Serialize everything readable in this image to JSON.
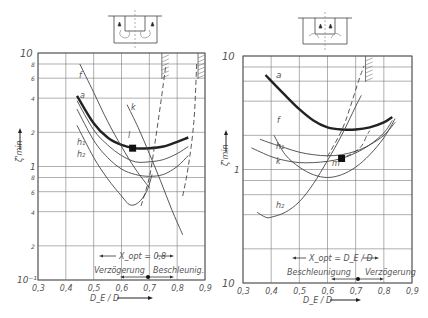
{
  "chart_data": [
    {
      "type": "line",
      "title": "",
      "xlabel": "D_E / D",
      "ylabel": "ζ'_min",
      "yscale": "log",
      "xlim": [
        0.3,
        0.9
      ],
      "ylim": [
        0.1,
        10
      ],
      "x_ticks": [
        "0,3",
        "0,4",
        "0,5",
        "0,6",
        "0,7",
        "0,8",
        "0,9"
      ],
      "y_ticks": [
        "10",
        "8",
        "6",
        "4",
        "2",
        "1",
        "8",
        "6",
        "4",
        "2",
        "10⁻¹"
      ],
      "grid": true,
      "annotations": {
        "x_opt": "X_opt = 0,8",
        "left_region": "Verzögerung",
        "right_region": "Beschleunig.",
        "marker_point": {
          "x": 0.64,
          "y": 1.45,
          "label": "l"
        }
      },
      "series": [
        {
          "name": "a",
          "style": "thick",
          "x": [
            0.44,
            0.5,
            0.55,
            0.6,
            0.65,
            0.7,
            0.75,
            0.8,
            0.84
          ],
          "y": [
            4.2,
            2.4,
            1.8,
            1.55,
            1.45,
            1.45,
            1.5,
            1.65,
            1.8
          ]
        },
        {
          "name": "f",
          "style": "thin",
          "x": [
            0.45,
            0.5,
            0.55,
            0.6,
            0.65,
            0.7
          ],
          "y": [
            8.0,
            4.5,
            2.5,
            1.5,
            0.95,
            0.65
          ]
        },
        {
          "name": "k",
          "style": "thin",
          "x": [
            0.62,
            0.66,
            0.7,
            0.74,
            0.78,
            0.82
          ],
          "y": [
            3.5,
            2.2,
            1.3,
            0.75,
            0.42,
            0.25
          ]
        },
        {
          "name": "h1",
          "style": "thin",
          "x": [
            0.44,
            0.5,
            0.55,
            0.6,
            0.65,
            0.7,
            0.75,
            0.8,
            0.84
          ],
          "y": [
            3.8,
            2.1,
            1.55,
            1.25,
            1.1,
            1.1,
            1.15,
            1.3,
            1.5
          ]
        },
        {
          "name": "h2",
          "style": "thin",
          "x": [
            0.44,
            0.5,
            0.55,
            0.6,
            0.65,
            0.7,
            0.75,
            0.8,
            0.84
          ],
          "y": [
            3.2,
            1.7,
            1.2,
            0.95,
            0.85,
            0.82,
            0.85,
            1.0,
            1.25
          ]
        },
        {
          "name": "lowest",
          "style": "thin",
          "x": [
            0.44,
            0.5,
            0.55,
            0.6,
            0.63,
            0.66,
            0.69,
            0.71
          ],
          "y": [
            2.3,
            1.2,
            0.78,
            0.55,
            0.46,
            0.48,
            0.6,
            0.85
          ]
        },
        {
          "name": "dashed-1",
          "style": "dashed",
          "x": [
            0.67,
            0.7,
            0.72,
            0.74,
            0.76
          ],
          "y": [
            0.45,
            0.8,
            1.6,
            3.5,
            8.0
          ]
        },
        {
          "name": "dashed-2",
          "style": "dashed",
          "x": [
            0.82,
            0.84,
            0.86,
            0.87
          ],
          "y": [
            0.55,
            1.0,
            2.5,
            8.0
          ]
        }
      ]
    },
    {
      "type": "line",
      "title": "",
      "xlabel": "D_E / D",
      "ylabel": "ζ'_min",
      "yscale": "log",
      "xlim": [
        0.3,
        0.9
      ],
      "ylim": [
        0.1,
        10
      ],
      "x_ticks": [
        "0,3",
        "0,4",
        "0,5",
        "0,6",
        "0,7",
        "0,8",
        "0,9"
      ],
      "y_ticks": [
        "10",
        "1",
        "10"
      ],
      "grid": true,
      "annotations": {
        "x_opt": "X_opt = D_E / D",
        "left_region": "Beschleunigung",
        "right_region": "Verzögerung",
        "marker_point": {
          "x": 0.65,
          "y": 1.25,
          "label": "m"
        }
      },
      "series": [
        {
          "name": "a",
          "style": "thick",
          "x": [
            0.38,
            0.45,
            0.5,
            0.55,
            0.6,
            0.65,
            0.7,
            0.75,
            0.8,
            0.83
          ],
          "y": [
            6.8,
            4.5,
            3.4,
            2.7,
            2.35,
            2.25,
            2.25,
            2.35,
            2.6,
            2.9
          ]
        },
        {
          "name": "f",
          "style": "thin",
          "x": [
            0.41,
            0.45,
            0.5,
            0.55,
            0.6,
            0.65,
            0.7,
            0.75,
            0.8,
            0.84
          ],
          "y": [
            2.0,
            1.35,
            1.05,
            0.9,
            0.85,
            0.9,
            1.05,
            1.35,
            1.9,
            2.8
          ]
        },
        {
          "name": "h1",
          "style": "thin",
          "x": [
            0.36,
            0.4,
            0.45,
            0.5,
            0.55,
            0.6,
            0.65,
            0.7,
            0.75,
            0.8,
            0.84
          ],
          "y": [
            1.85,
            1.7,
            1.55,
            1.42,
            1.35,
            1.32,
            1.35,
            1.45,
            1.65,
            2.0,
            2.6
          ]
        },
        {
          "name": "k",
          "style": "thin",
          "x": [
            0.33,
            0.4,
            0.45,
            0.5,
            0.55,
            0.6,
            0.65,
            0.7,
            0.75,
            0.8,
            0.83
          ],
          "y": [
            1.55,
            1.3,
            1.2,
            1.15,
            1.15,
            1.18,
            1.25,
            1.4,
            1.65,
            2.1,
            2.7
          ]
        },
        {
          "name": "h2",
          "style": "thin",
          "x": [
            0.35,
            0.38,
            0.4,
            0.45,
            0.5,
            0.55,
            0.6,
            0.65,
            0.7,
            0.72
          ],
          "y": [
            0.42,
            0.38,
            0.38,
            0.42,
            0.52,
            0.75,
            1.2,
            2.0,
            3.6,
            4.5
          ]
        },
        {
          "name": "dashed",
          "style": "dashed",
          "x": [
            0.64,
            0.68,
            0.72,
            0.74,
            0.75
          ],
          "y": [
            1.25,
            1.35,
            1.6,
            2.0,
            2.2
          ]
        },
        {
          "name": "dashed-rise",
          "style": "dashed",
          "x": [
            0.6,
            0.65,
            0.68,
            0.71,
            0.73
          ],
          "y": [
            1.3,
            2.2,
            3.5,
            6.0,
            8.2
          ]
        }
      ]
    }
  ],
  "left": {
    "y_top": "10",
    "y_ticks": [
      {
        "v": 8,
        "t": "8"
      },
      {
        "v": 6,
        "t": "6"
      },
      {
        "v": 4,
        "t": "4"
      },
      {
        "v": 2,
        "t": "2"
      },
      {
        "v": 1,
        "t": "1"
      },
      {
        "v": 0.8,
        "t": "8"
      },
      {
        "v": 0.6,
        "t": "6"
      },
      {
        "v": 0.4,
        "t": "4"
      },
      {
        "v": 0.2,
        "t": "2"
      }
    ],
    "y_bottom": "10⁻¹",
    "x_ticks": [
      "0,3",
      "0,4",
      "0,5",
      "0,6",
      "0,7",
      "0,8",
      "0,9"
    ],
    "xlabel": "D_E / D",
    "ylabel": "ζ'min",
    "xopt": "X_opt = 0,8",
    "region_left": "Verzögerung",
    "region_right": "Beschleunig.",
    "labels": {
      "a": "a",
      "f": "f",
      "k": "k",
      "h1": "h₁",
      "h2": "h₂",
      "l": "l"
    }
  },
  "right": {
    "y_top": "10",
    "y_one": "1",
    "y_bottom": "10",
    "x_ticks": [
      "0,3",
      "0,4",
      "0,5",
      "0,6",
      "0,7",
      "0,8",
      "0,9"
    ],
    "xlabel": "D_E / D",
    "ylabel": "ζ'min",
    "xopt": "X_opt = D_E / D",
    "region_left": "Beschleunigung",
    "region_right": "Verzögerung",
    "labels": {
      "a": "a",
      "f": "f",
      "k": "k",
      "h1": "h₁",
      "h2": "h₂",
      "m": "m"
    }
  }
}
